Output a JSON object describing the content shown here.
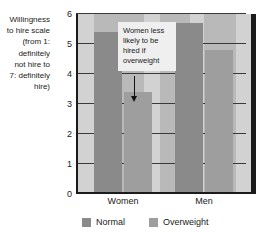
{
  "chart_data": {
    "type": "bar",
    "title": "",
    "xlabel": "",
    "ylabel": "Willingness to hire scale (from 1: definitely not hire to 7: definitely hire)",
    "ylabel_lines": [
      "Willingness",
      "to hire scale",
      "(from 1:",
      "definitely",
      "not hire to",
      "7: definitely",
      "hire)"
    ],
    "categories": [
      "Women",
      "Men"
    ],
    "series": [
      {
        "name": "Normal",
        "color": "#8a8a8a",
        "values": [
          5.4,
          5.7
        ]
      },
      {
        "name": "Overweight",
        "color": "#9e9e9e",
        "values": [
          3.4,
          4.8
        ]
      }
    ],
    "ylim": [
      0,
      6
    ],
    "yticks": [
      0,
      1,
      2,
      3,
      4,
      5,
      6
    ],
    "ytick_labels": [
      "0",
      "1",
      "2",
      "3",
      "4",
      "5",
      "6"
    ],
    "grid": true,
    "legend_position": "bottom",
    "annotations": [
      {
        "text": "Women less likely to be hired if overweight",
        "lines": [
          "Women less",
          "likely to be",
          "hired if",
          "overweight"
        ],
        "points_to": "Women-Overweight"
      }
    ],
    "plot_background": "#b9b9b9",
    "band_color": "#d2d2d2",
    "axis_color": "#1b1b1b"
  },
  "axis": {
    "y_title_lines": [
      "Willingness",
      "to hire scale",
      "(from 1:",
      "definitely",
      "not hire to",
      "7: definitely",
      "hire)"
    ],
    "y_ticks": [
      "6",
      "5",
      "4",
      "3",
      "2",
      "1",
      "0"
    ],
    "x_labels": [
      "Women",
      "Men"
    ]
  },
  "callout": {
    "line1": "Women less",
    "line2": "likely to be",
    "line3": "hired if",
    "line4": "overweight"
  },
  "legend": {
    "normal_label": "Normal",
    "overweight_label": "Overweight"
  }
}
